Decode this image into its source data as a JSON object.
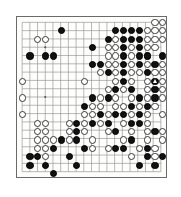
{
  "board": {
    "title": "go-board",
    "size": 19,
    "grid_color": "#8a8a8a",
    "border_color": "#6a6a6a",
    "background_color": "#fdfdfc",
    "black_color": "#111111",
    "white_color": "#ffffff",
    "star_points": [
      [
        3,
        3
      ],
      [
        9,
        3
      ],
      [
        15,
        3
      ],
      [
        3,
        9
      ],
      [
        9,
        9
      ],
      [
        15,
        9
      ],
      [
        3,
        15
      ],
      [
        9,
        15
      ],
      [
        15,
        15
      ]
    ],
    "black_stones": [
      [
        5,
        1
      ],
      [
        12,
        1
      ],
      [
        13,
        1
      ],
      [
        14,
        1
      ],
      [
        15,
        1
      ],
      [
        11,
        2
      ],
      [
        13,
        2
      ],
      [
        14,
        2
      ],
      [
        15,
        2
      ],
      [
        9,
        3
      ],
      [
        13,
        3
      ],
      [
        15,
        3
      ],
      [
        1,
        4
      ],
      [
        3,
        4
      ],
      [
        4,
        4
      ],
      [
        13,
        4
      ],
      [
        15,
        4
      ],
      [
        16,
        4
      ],
      [
        18,
        4
      ],
      [
        9,
        5
      ],
      [
        10,
        5
      ],
      [
        13,
        5
      ],
      [
        15,
        5
      ],
      [
        17,
        5
      ],
      [
        11,
        6
      ],
      [
        13,
        6
      ],
      [
        16,
        6
      ],
      [
        13,
        7
      ],
      [
        17,
        7
      ],
      [
        12,
        8
      ],
      [
        14,
        8
      ],
      [
        17,
        8
      ],
      [
        9,
        9
      ],
      [
        11,
        9
      ],
      [
        15,
        9
      ],
      [
        17,
        9
      ],
      [
        8,
        10
      ],
      [
        14,
        10
      ],
      [
        16,
        10
      ],
      [
        10,
        11
      ],
      [
        12,
        11
      ],
      [
        13,
        11
      ],
      [
        15,
        11
      ],
      [
        7,
        12
      ],
      [
        9,
        12
      ],
      [
        11,
        12
      ],
      [
        14,
        12
      ],
      [
        15,
        12
      ],
      [
        7,
        13
      ],
      [
        12,
        13
      ],
      [
        17,
        13
      ],
      [
        5,
        14
      ],
      [
        7,
        14
      ],
      [
        14,
        14
      ],
      [
        4,
        15
      ],
      [
        8,
        15
      ],
      [
        12,
        15
      ],
      [
        13,
        15
      ],
      [
        16,
        15
      ],
      [
        1,
        16
      ],
      [
        2,
        16
      ],
      [
        6,
        16
      ],
      [
        16,
        16
      ],
      [
        18,
        16
      ],
      [
        1,
        17
      ],
      [
        3,
        17
      ],
      [
        7,
        17
      ],
      [
        15,
        17
      ],
      [
        17,
        17
      ],
      [
        4,
        18
      ]
    ],
    "white_stones": [
      [
        17,
        0
      ],
      [
        18,
        0
      ],
      [
        16,
        1
      ],
      [
        17,
        1
      ],
      [
        18,
        1
      ],
      [
        2,
        2
      ],
      [
        3,
        2
      ],
      [
        12,
        2
      ],
      [
        16,
        2
      ],
      [
        17,
        2
      ],
      [
        18,
        2
      ],
      [
        11,
        3
      ],
      [
        12,
        3
      ],
      [
        14,
        3
      ],
      [
        16,
        3
      ],
      [
        17,
        3
      ],
      [
        11,
        4
      ],
      [
        12,
        4
      ],
      [
        14,
        4
      ],
      [
        16,
        4
      ],
      [
        11,
        5
      ],
      [
        12,
        5
      ],
      [
        14,
        5
      ],
      [
        16,
        5
      ],
      [
        18,
        5
      ],
      [
        10,
        6
      ],
      [
        12,
        6
      ],
      [
        14,
        6
      ],
      [
        15,
        6
      ],
      [
        17,
        6
      ],
      [
        18,
        6
      ],
      [
        0,
        7
      ],
      [
        8,
        7
      ],
      [
        12,
        7
      ],
      [
        14,
        7
      ],
      [
        16,
        7
      ],
      [
        18,
        7
      ],
      [
        11,
        8
      ],
      [
        13,
        8
      ],
      [
        16,
        8
      ],
      [
        18,
        8
      ],
      [
        0,
        9
      ],
      [
        10,
        9
      ],
      [
        12,
        9
      ],
      [
        14,
        9
      ],
      [
        16,
        9
      ],
      [
        18,
        9
      ],
      [
        9,
        10
      ],
      [
        10,
        10
      ],
      [
        12,
        10
      ],
      [
        13,
        10
      ],
      [
        15,
        10
      ],
      [
        17,
        10
      ],
      [
        0,
        11
      ],
      [
        8,
        11
      ],
      [
        9,
        11
      ],
      [
        11,
        11
      ],
      [
        14,
        11
      ],
      [
        16,
        11
      ],
      [
        18,
        11
      ],
      [
        2,
        12
      ],
      [
        3,
        12
      ],
      [
        6,
        12
      ],
      [
        8,
        12
      ],
      [
        10,
        12
      ],
      [
        13,
        12
      ],
      [
        16,
        12
      ],
      [
        2,
        13
      ],
      [
        3,
        13
      ],
      [
        6,
        13
      ],
      [
        8,
        13
      ],
      [
        11,
        13
      ],
      [
        14,
        13
      ],
      [
        16,
        13
      ],
      [
        18,
        13
      ],
      [
        2,
        14
      ],
      [
        3,
        14
      ],
      [
        4,
        14
      ],
      [
        6,
        14
      ],
      [
        9,
        14
      ],
      [
        13,
        14
      ],
      [
        16,
        14
      ],
      [
        18,
        14
      ],
      [
        2,
        15
      ],
      [
        3,
        15
      ],
      [
        9,
        15
      ],
      [
        11,
        15
      ],
      [
        15,
        15
      ],
      [
        17,
        15
      ],
      [
        3,
        16
      ],
      [
        14,
        16
      ],
      [
        17,
        16
      ]
    ],
    "marked_stones": [
      {
        "col": 17,
        "row": 7,
        "color": "black",
        "marker": "triangle"
      }
    ]
  }
}
